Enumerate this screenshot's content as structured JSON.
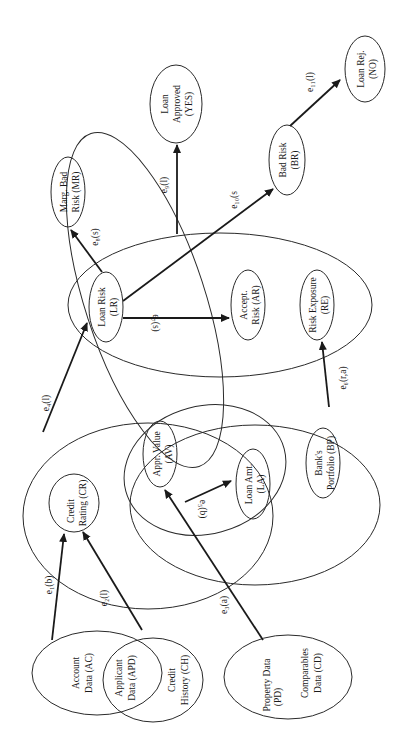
{
  "diagram": {
    "orientation": "rotated-90-ccw",
    "nodes": {
      "ac": {
        "line1": "Account",
        "line2": "Data (AC)"
      },
      "apd": {
        "line1": "Applicant",
        "line2": "Data (APD)"
      },
      "ch": {
        "line1": "Credit",
        "line2": "History (CH)"
      },
      "pd": {
        "line1": "Property  Data",
        "line2": "(PD)"
      },
      "cd": {
        "line1": "Comparables",
        "line2": "Data (CD)"
      },
      "cr": {
        "line1": "Credit",
        "line2": "Rating  (CR)"
      },
      "av": {
        "line1": "Appr. Value",
        "line2": "(AV)"
      },
      "la": {
        "line1": "Loan Amt.",
        "line2": "(LA)"
      },
      "bp": {
        "line1": "Bank's",
        "line2": "Portfolio (BP)"
      },
      "lr": {
        "line1": "Loan Risk",
        "line2": "(LR)"
      },
      "mr": {
        "line1": "Marg. Bad",
        "line2": "Risk (MR)"
      },
      "ar": {
        "line1": "Accept.",
        "line2": "Risk (AR)"
      },
      "re": {
        "line1": "Risk Exposure",
        "line2": "(RE)"
      },
      "yes": {
        "line1": "Loan",
        "line2": "Approved",
        "line3": "(YES)"
      },
      "br": {
        "line1": "Bad Risk",
        "line2": "(BR)"
      },
      "no": {
        "line1": "Loan Rej.",
        "line2": "(NO)"
      }
    },
    "edges": {
      "e1": {
        "label": "e₁(b)",
        "from": "Account Data (AC)",
        "to": "Credit Rating (CR)"
      },
      "e2": {
        "label": "e₂(l)",
        "from": "Credit History (CH)",
        "to": "Credit Rating (CR)"
      },
      "e3": {
        "label": "e₃(a)",
        "from": "Property Data (PD)",
        "to": "Appr. Value (AV)"
      },
      "e4": {
        "label": "e₄(l)",
        "from": "Credit Rating group",
        "to": "Loan Risk (LR)"
      },
      "e5": {
        "label": "e₅(b)",
        "from": "Appr. Value (AV)",
        "to": "Loan Amt. (LA)"
      },
      "e6": {
        "label": "e₆(r,a)",
        "from": "Bank's Portfolio group",
        "to": "Risk Exposure (RE)"
      },
      "e7": {
        "label": "e₇(s)",
        "from": "Loan Risk (LR)",
        "to": "Accept. Risk (AR)"
      },
      "e8": {
        "label": "e₈(s)",
        "from": "Loan Risk (LR)",
        "to": "Marg. Bad Risk (MR)"
      },
      "e9": {
        "label": "e₉(l)",
        "from": "Loan Risk group",
        "to": "Loan Approved (YES)"
      },
      "e10": {
        "label": "e₁₀(s",
        "from": "Loan Risk (LR)",
        "to": "Bad Risk (BR)"
      },
      "e11": {
        "label": "e₁₁(l)",
        "from": "Bad Risk (BR)",
        "to": "Loan Rej. (NO)"
      }
    }
  }
}
